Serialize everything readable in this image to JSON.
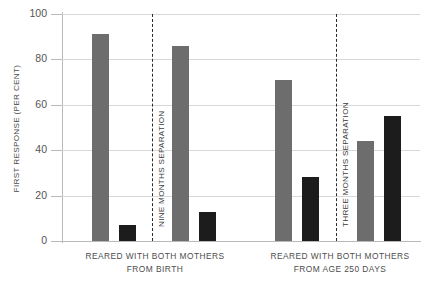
{
  "chart_data": {
    "type": "bar",
    "title": "",
    "xlabel": "",
    "ylabel": "FIRST RESPONSE (PER CENT)",
    "ylim": [
      0,
      100
    ],
    "grid": true,
    "legend": "none",
    "yticks": [
      {
        "value": 100,
        "label": "100"
      },
      {
        "value": 80,
        "label": "80"
      },
      {
        "value": 60,
        "label": "60"
      },
      {
        "value": 40,
        "label": "40"
      },
      {
        "value": 20,
        "label": "20"
      },
      {
        "value": 0,
        "label": "0"
      }
    ],
    "categories": [
      "1",
      "2",
      "3",
      "4",
      "5",
      "6",
      "7",
      "8"
    ],
    "values": [
      91,
      7,
      86,
      13,
      71,
      28,
      44,
      55
    ],
    "bars": [
      {
        "value": 91,
        "color": "#6d6d6d",
        "shade": "gray",
        "x": 92,
        "width": 17
      },
      {
        "value": 7,
        "color": "#1c1c1c",
        "shade": "black",
        "x": 119,
        "width": 17
      },
      {
        "value": 86,
        "color": "#6d6d6d",
        "shade": "gray",
        "x": 172,
        "width": 17
      },
      {
        "value": 13,
        "color": "#1c1c1c",
        "shade": "black",
        "x": 199,
        "width": 17
      },
      {
        "value": 71,
        "color": "#6d6d6d",
        "shade": "gray",
        "x": 275,
        "width": 17
      },
      {
        "value": 28,
        "color": "#1c1c1c",
        "shade": "black",
        "x": 302,
        "width": 17
      },
      {
        "value": 44,
        "color": "#6d6d6d",
        "shade": "gray",
        "x": 357,
        "width": 17
      },
      {
        "value": 55,
        "color": "#1c1c1c",
        "shade": "black",
        "x": 384,
        "width": 17
      }
    ],
    "annotations": [
      {
        "type": "vertical-dashed-line",
        "label": "NINE MONTHS SEPARATION",
        "x": 152
      },
      {
        "type": "vertical-dashed-line",
        "label": "THREE MONTHS SEPARATION",
        "x": 336
      }
    ],
    "group_captions": [
      {
        "line1": "REARED WITH BOTH MOTHERS",
        "line2": "FROM BIRTH",
        "center_x": 155
      },
      {
        "line1": "REARED WITH BOTH MOTHERS",
        "line2": "FROM AGE 250 DAYS",
        "center_x": 340
      }
    ],
    "colors": {
      "gray_bar": "#6d6d6d",
      "black_bar": "#1c1c1c",
      "gridline": "#d8d8d8",
      "axis": "#b9b9b9",
      "text": "#4a4a4a",
      "background": "#ffffff"
    }
  }
}
